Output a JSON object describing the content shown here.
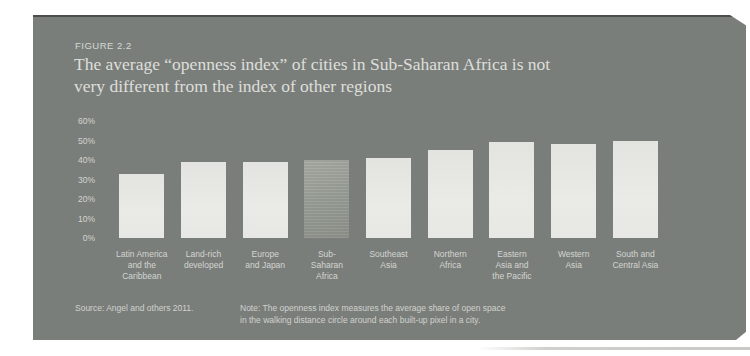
{
  "figure": {
    "label": "FIGURE 2.2",
    "title_line1": "The average “openness index” of cities in Sub-Saharan Africa is not",
    "title_line2": "very different from the index of other regions"
  },
  "footer": {
    "source": "Source: Angel and others 2011.",
    "note_line1": "Note: The openness index measures the average share of open space",
    "note_line2": "in the walking distance circle around each built-up pixel in a city."
  },
  "colors": {
    "page_background": "#ffffff",
    "panel_background": "#7a7e7a",
    "panel_top_edge": "#4b4e4b",
    "bar_fill": "#e8e9e5",
    "bar_highlight_fill": "#999e97",
    "text_light": "#d6d8d4"
  },
  "chart_data": {
    "type": "bar",
    "figure_label": "FIGURE 2.2",
    "title": "The average “openness index” of cities in Sub-Saharan Africa is not very different from the index of other regions",
    "categories": [
      "Latin America and the Caribbean",
      "Land-rich developed",
      "Europe and Japan",
      "Sub-Saharan Africa",
      "Southeast Asia",
      "Northern Africa",
      "Eastern Asia and the Pacific",
      "Western Asia",
      "South and Central Asia"
    ],
    "category_label_lines": [
      [
        "Latin America",
        "and the",
        "Caribbean"
      ],
      [
        "Land-rich",
        "developed"
      ],
      [
        "Europe",
        "and Japan"
      ],
      [
        "Sub-",
        "Saharan",
        "Africa"
      ],
      [
        "Southeast",
        "Asia"
      ],
      [
        "Northern",
        "Africa"
      ],
      [
        "Eastern",
        "Asia and",
        "the Pacific"
      ],
      [
        "Western",
        "Asia"
      ],
      [
        "South and",
        "Central Asia"
      ]
    ],
    "values": [
      33,
      39,
      39,
      40,
      41,
      45,
      49,
      48,
      50
    ],
    "unit": "%",
    "highlight_index": 3,
    "highlight_category": "Sub-Saharan Africa",
    "y_ticks": [
      60,
      50,
      40,
      30,
      20,
      10,
      0
    ],
    "y_tick_labels": [
      "60%",
      "50%",
      "40%",
      "30%",
      "20%",
      "10%",
      "0%"
    ],
    "ylim": [
      0,
      60
    ],
    "grid": false,
    "legend": false,
    "source": "Source: Angel and others 2011.",
    "note": "Note: The openness index measures the average share of open space in the walking distance circle around each built-up pixel in a city."
  }
}
